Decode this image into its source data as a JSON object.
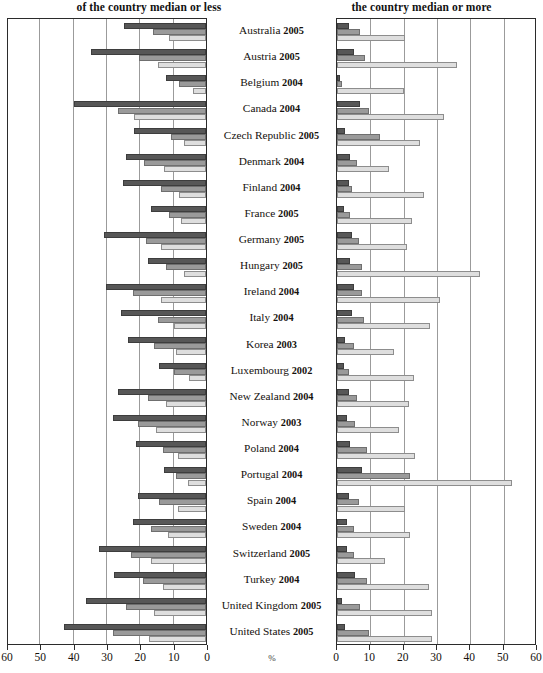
{
  "header": {
    "left_title": "of the country median or less",
    "right_title": "the country median or more"
  },
  "axis": {
    "unit_label": "%",
    "left_ticks": [
      "60",
      "50",
      "40",
      "30",
      "20",
      "10",
      "0"
    ],
    "right_ticks": [
      "0",
      "10",
      "20",
      "30",
      "40",
      "50",
      "60"
    ],
    "max": 60,
    "step": 10
  },
  "colors": {
    "series_dark": "#575757",
    "series_medium": "#9a9a9a",
    "series_light": "#dedede",
    "grid": "#9b9b9b",
    "frame": "#2b2b2b",
    "text": "#15110d"
  },
  "chart_data": {
    "type": "bar",
    "orientation": "horizontal",
    "layout": "bidirectional-paired-panels",
    "title": "",
    "subtitle": "",
    "xlabel": "%",
    "ylabel": "",
    "xlim": [
      0,
      60
    ],
    "grid": true,
    "legend_position": "none",
    "series_names": [
      "series-1-dark",
      "series-2-medium",
      "series-3-light"
    ],
    "panels": [
      {
        "name": "left",
        "title": "of the country median or less",
        "direction": "left"
      },
      {
        "name": "right",
        "title": "the country median or more",
        "direction": "right"
      }
    ],
    "categories": [
      "Australia 2005",
      "Austria 2005",
      "Belgium 2004",
      "Canada 2004",
      "Czech Republic 2005",
      "Denmark 2004",
      "Finland 2004",
      "France 2005",
      "Germany 2005",
      "Hungary 2005",
      "Ireland 2004",
      "Italy 2004",
      "Korea 2003",
      "Luxembourg 2002",
      "New Zealand 2004",
      "Norway 2003",
      "Poland 2004",
      "Portugal 2004",
      "Spain 2004",
      "Sweden 2004",
      "Switzerland 2005",
      "Turkey 2004",
      "United Kingdom 2005",
      "United States 2005"
    ],
    "countries": [
      {
        "country": "Australia",
        "year": "2005",
        "left": [
          24.5,
          16.0,
          11.0
        ],
        "right": [
          3.5,
          7.0,
          20.5
        ]
      },
      {
        "country": "Austria",
        "year": "2005",
        "left": [
          34.5,
          20.0,
          14.5
        ],
        "right": [
          5.0,
          8.5,
          36.0
        ]
      },
      {
        "country": "Belgium",
        "year": "2004",
        "left": [
          12.0,
          8.0,
          4.0
        ],
        "right": [
          1.0,
          1.5,
          20.0
        ]
      },
      {
        "country": "Canada",
        "year": "2004",
        "left": [
          39.5,
          26.5,
          21.5
        ],
        "right": [
          7.0,
          9.5,
          32.0
        ]
      },
      {
        "country": "Czech Republic",
        "year": "2005",
        "left": [
          21.5,
          10.5,
          6.5
        ],
        "right": [
          2.5,
          13.0,
          25.0
        ]
      },
      {
        "country": "Denmark",
        "year": "2004",
        "left": [
          24.0,
          18.5,
          12.5
        ],
        "right": [
          4.0,
          6.0,
          15.5
        ]
      },
      {
        "country": "Finland",
        "year": "2004",
        "left": [
          25.0,
          13.5,
          8.0
        ],
        "right": [
          3.5,
          4.5,
          26.0
        ]
      },
      {
        "country": "France",
        "year": "2005",
        "left": [
          16.5,
          11.0,
          7.5
        ],
        "right": [
          2.0,
          4.0,
          22.5
        ]
      },
      {
        "country": "Germany",
        "year": "2005",
        "left": [
          30.5,
          18.0,
          13.5
        ],
        "right": [
          4.5,
          6.5,
          21.0
        ]
      },
      {
        "country": "Hungary",
        "year": "2005",
        "left": [
          17.5,
          12.0,
          6.5
        ],
        "right": [
          4.0,
          7.5,
          43.0
        ]
      },
      {
        "country": "Ireland",
        "year": "2004",
        "left": [
          30.0,
          22.0,
          13.5
        ],
        "right": [
          5.0,
          7.5,
          31.0
        ]
      },
      {
        "country": "Italy",
        "year": "2004",
        "left": [
          25.5,
          14.5,
          9.5
        ],
        "right": [
          4.5,
          8.0,
          28.0
        ]
      },
      {
        "country": "Korea",
        "year": "2003",
        "left": [
          23.5,
          15.5,
          9.0
        ],
        "right": [
          2.5,
          5.0,
          17.0
        ]
      },
      {
        "country": "Luxembourg",
        "year": "2002",
        "left": [
          14.0,
          9.5,
          5.0
        ],
        "right": [
          2.0,
          3.5,
          23.0
        ]
      },
      {
        "country": "New Zealand",
        "year": "2004",
        "left": [
          26.5,
          17.5,
          12.0
        ],
        "right": [
          3.5,
          6.0,
          21.5
        ]
      },
      {
        "country": "Norway",
        "year": "2003",
        "left": [
          28.0,
          20.5,
          15.0
        ],
        "right": [
          3.0,
          5.5,
          18.5
        ]
      },
      {
        "country": "Poland",
        "year": "2004",
        "left": [
          21.0,
          13.0,
          8.5
        ],
        "right": [
          4.0,
          9.0,
          23.5
        ]
      },
      {
        "country": "Portugal",
        "year": "2004",
        "left": [
          12.5,
          9.0,
          5.5
        ],
        "right": [
          7.5,
          22.0,
          52.5
        ]
      },
      {
        "country": "Spain",
        "year": "2004",
        "left": [
          20.5,
          14.0,
          8.5
        ],
        "right": [
          3.5,
          6.5,
          20.5
        ]
      },
      {
        "country": "Sweden",
        "year": "2004",
        "left": [
          22.0,
          16.5,
          11.5
        ],
        "right": [
          3.0,
          5.0,
          22.0
        ]
      },
      {
        "country": "Switzerland",
        "year": "2005",
        "left": [
          32.0,
          22.5,
          16.5
        ],
        "right": [
          3.0,
          5.0,
          14.5
        ]
      },
      {
        "country": "Turkey",
        "year": "2004",
        "left": [
          27.5,
          19.0,
          13.0
        ],
        "right": [
          5.5,
          9.0,
          27.5
        ]
      },
      {
        "country": "United Kingdom",
        "year": "2005",
        "left": [
          36.0,
          24.0,
          15.5
        ],
        "right": [
          1.5,
          7.0,
          28.5
        ]
      },
      {
        "country": "United States",
        "year": "2005",
        "left": [
          42.5,
          28.0,
          17.0
        ],
        "right": [
          2.5,
          9.5,
          28.5
        ]
      }
    ]
  }
}
